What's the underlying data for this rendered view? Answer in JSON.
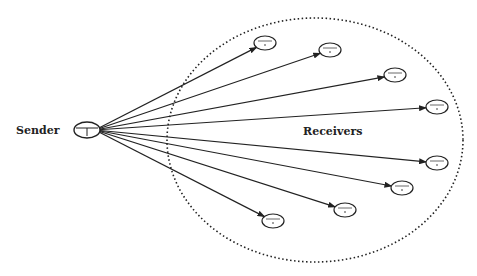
{
  "diagram": {
    "type": "multicast",
    "sender": {
      "label": "Sender",
      "x": 87,
      "y": 130
    },
    "receivers_group": {
      "label": "Receivers",
      "cx": 315,
      "cy": 140,
      "rx": 148,
      "ry": 122
    },
    "receivers": [
      {
        "id": "r1",
        "x": 265,
        "y": 43
      },
      {
        "id": "r2",
        "x": 330,
        "y": 50
      },
      {
        "id": "r3",
        "x": 395,
        "y": 75
      },
      {
        "id": "r4",
        "x": 437,
        "y": 107
      },
      {
        "id": "r5",
        "x": 437,
        "y": 163
      },
      {
        "id": "r6",
        "x": 402,
        "y": 188
      },
      {
        "id": "r7",
        "x": 345,
        "y": 210
      },
      {
        "id": "r8",
        "x": 273,
        "y": 221
      }
    ],
    "colors": {
      "stroke": "#222222",
      "background": "#ffffff"
    }
  }
}
